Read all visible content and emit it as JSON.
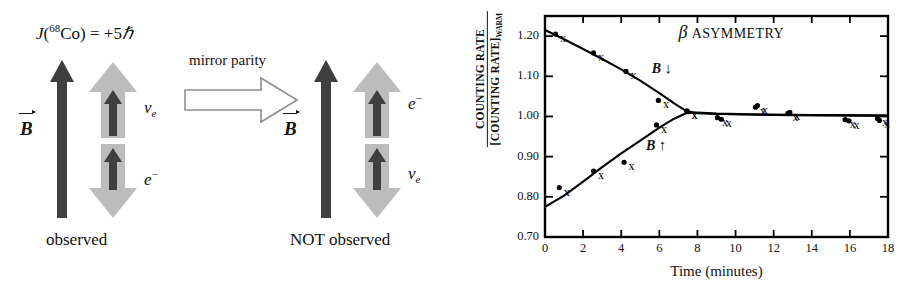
{
  "figure": {
    "left_panel": {
      "name": "parity-violation-diagram",
      "spin_label": {
        "prefix": "J(",
        "isotope_mass": "68",
        "element": "Co",
        "equals": ") = +5",
        "hbar": "ℏ",
        "full": "J(68Co) = +5ℏ"
      },
      "mirror_operation_label": "mirror parity",
      "groups": [
        {
          "id": "observed",
          "caption": "observed",
          "field_label": "B",
          "field_direction": "up",
          "particles": [
            {
              "label": "ν",
              "sub": "e",
              "superscript": "",
              "position": "top",
              "momentum": "up",
              "spin": "up"
            },
            {
              "label": "e",
              "sub": "",
              "superscript": "−",
              "position": "bottom",
              "momentum": "down",
              "spin": "up"
            }
          ]
        },
        {
          "id": "not-observed",
          "caption": "NOT observed",
          "field_label": "B",
          "field_direction": "up",
          "particles": [
            {
              "label": "e",
              "sub": "",
              "superscript": "−",
              "position": "top",
              "momentum": "up",
              "spin": "up"
            },
            {
              "label": "ν",
              "sub": "e",
              "superscript": "",
              "position": "bottom",
              "momentum": "down",
              "spin": "up"
            }
          ]
        }
      ]
    },
    "colors": {
      "dark_arrow": "#3a3a3a",
      "light_arrow": "#b8b8b8",
      "outline_arrow_stroke": "#8c8c8c",
      "axis": "#000000",
      "curve": "#000000"
    }
  },
  "chart_data": {
    "type": "scatter",
    "title_beta": "β",
    "title_rest": "ASYMMETRY",
    "xlabel": "Time (minutes)",
    "ylabel_numerator": "COUNTING RATE",
    "ylabel_denominator": "[COUNTING RATE]",
    "ylabel_denominator_sub": "WARM",
    "xlim": [
      0,
      18
    ],
    "ylim": [
      0.7,
      1.25
    ],
    "xticks": [
      0,
      2,
      4,
      6,
      8,
      10,
      12,
      14,
      16,
      18
    ],
    "xticklabels": [
      "0",
      "2",
      "4",
      "6",
      "8",
      "10",
      "12",
      "14",
      "16",
      "18"
    ],
    "yticks": [
      0.7,
      0.8,
      0.9,
      1.0,
      1.1,
      1.2
    ],
    "yticklabels": [
      "0.70",
      "0.80",
      "0.90",
      "1.00",
      "1.10",
      "1.20"
    ],
    "grid": false,
    "legend": "inline-annotations",
    "annotations": [
      {
        "text": "B",
        "arrow": "↓",
        "x": 5.6,
        "y": 1.115,
        "name": "b-field-down-annotation"
      },
      {
        "text": "B",
        "arrow": "↑",
        "x": 5.3,
        "y": 0.925,
        "name": "b-field-up-annotation"
      }
    ],
    "series": [
      {
        "name": "B down",
        "marker": "x",
        "marker_label": "x",
        "points": [
          {
            "x": 0.55,
            "y": 1.205
          },
          {
            "x": 2.55,
            "y": 1.158
          },
          {
            "x": 4.25,
            "y": 1.112
          },
          {
            "x": 5.95,
            "y": 1.04
          },
          {
            "x": 7.45,
            "y": 1.014
          },
          {
            "x": 9.25,
            "y": 0.993
          },
          {
            "x": 11.15,
            "y": 1.027
          },
          {
            "x": 12.85,
            "y": 1.01
          },
          {
            "x": 15.95,
            "y": 0.989
          },
          {
            "x": 17.55,
            "y": 0.99
          }
        ],
        "curve": [
          {
            "x": 0.0,
            "y": 1.215
          },
          {
            "x": 1.0,
            "y": 1.192
          },
          {
            "x": 2.0,
            "y": 1.168
          },
          {
            "x": 3.0,
            "y": 1.143
          },
          {
            "x": 4.0,
            "y": 1.117
          },
          {
            "x": 5.0,
            "y": 1.089
          },
          {
            "x": 6.0,
            "y": 1.058
          },
          {
            "x": 6.8,
            "y": 1.032
          },
          {
            "x": 7.4,
            "y": 1.014
          },
          {
            "x": 8.0,
            "y": 1.008
          },
          {
            "x": 9.0,
            "y": 1.006
          },
          {
            "x": 12.0,
            "y": 1.004
          },
          {
            "x": 18.0,
            "y": 1.002
          }
        ]
      },
      {
        "name": "B up",
        "marker": "dot",
        "marker_label": "•",
        "points": [
          {
            "x": 0.75,
            "y": 0.823
          },
          {
            "x": 2.55,
            "y": 0.864
          },
          {
            "x": 4.15,
            "y": 0.886
          },
          {
            "x": 5.85,
            "y": 0.979
          },
          {
            "x": 7.45,
            "y": 1.013
          },
          {
            "x": 9.05,
            "y": 0.997
          },
          {
            "x": 11.05,
            "y": 1.023
          },
          {
            "x": 12.75,
            "y": 1.008
          },
          {
            "x": 15.75,
            "y": 0.992
          },
          {
            "x": 17.45,
            "y": 0.995
          }
        ],
        "curve": [
          {
            "x": 0.0,
            "y": 0.775
          },
          {
            "x": 1.0,
            "y": 0.803
          },
          {
            "x": 2.0,
            "y": 0.838
          },
          {
            "x": 3.0,
            "y": 0.874
          },
          {
            "x": 4.0,
            "y": 0.908
          },
          {
            "x": 5.0,
            "y": 0.94
          },
          {
            "x": 6.0,
            "y": 0.972
          },
          {
            "x": 6.8,
            "y": 0.995
          },
          {
            "x": 7.4,
            "y": 1.008
          },
          {
            "x": 8.0,
            "y": 1.01
          },
          {
            "x": 9.0,
            "y": 1.007
          },
          {
            "x": 12.0,
            "y": 1.004
          },
          {
            "x": 18.0,
            "y": 1.002
          }
        ]
      }
    ]
  }
}
